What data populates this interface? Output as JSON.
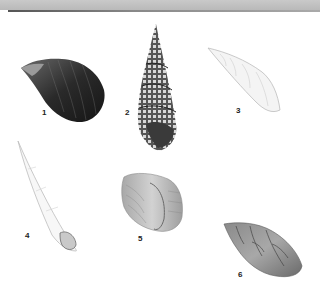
{
  "plate": {
    "header_color": "#c2c2c2",
    "rule_color": "#666666",
    "specimens": [
      {
        "number": "1",
        "description": "dark glossy ovate shell"
      },
      {
        "number": "2",
        "description": "tall turreted granulose shell"
      },
      {
        "number": "3",
        "description": "pale fusiform shell"
      },
      {
        "number": "4",
        "description": "slender pale awl-shaped shell"
      },
      {
        "number": "5",
        "description": "broad ribbed shell, aperture view"
      },
      {
        "number": "6",
        "description": "mottled brown ovate shell"
      }
    ]
  }
}
